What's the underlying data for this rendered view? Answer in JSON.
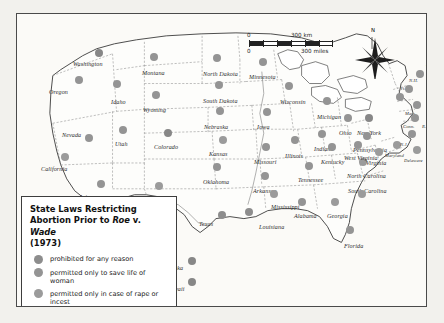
{
  "map": {
    "title": "State Laws Restricting Abortion Prior to Roe v. Wade (1973)",
    "frame_color": "#4a4a4a",
    "background_color": "#fbfaf7"
  },
  "legend": {
    "title_line1": "State Laws Restricting",
    "title_line2_a": "Abortion Prior to ",
    "title_line2_roe": "Roe",
    "title_line2_v": " v. ",
    "title_line2_wade": "Wade",
    "title_line3": "(1973)",
    "items": [
      {
        "label": "prohibited for any reason",
        "color": "#8d8d8d"
      },
      {
        "label": "permitted only to save life of woman",
        "color": "#949494"
      },
      {
        "label": "permitted only in case of rape or incest",
        "color": "#9b9b9b"
      },
      {
        "label": "permitted for any reason",
        "color": "#878787"
      }
    ]
  },
  "scalebar": {
    "km_zero": "0",
    "km_value": "300 km",
    "miles_zero": "0",
    "miles_value": "300 miles"
  },
  "compass": {
    "north_label": "N"
  },
  "chart_data": {
    "type": "map",
    "title": "State Laws Restricting Abortion Prior to Roe v. Wade (1973)",
    "categories": [
      "prohibited for any reason",
      "permitted only to save life of woman",
      "permitted only in case of rape or incest",
      "permitted for any reason"
    ],
    "states": [
      {
        "name": "Washington",
        "label_x": 56,
        "label_y": 47,
        "dot_x": 82,
        "dot_y": 39,
        "cat": 4
      },
      {
        "name": "Oregon",
        "label_x": 32,
        "label_y": 75,
        "dot_x": 62,
        "dot_y": 66,
        "cat": 2
      },
      {
        "name": "Idaho",
        "label_x": 94,
        "label_y": 85,
        "dot_x": 100,
        "dot_y": 70,
        "cat": 2
      },
      {
        "name": "Montana",
        "label_x": 125,
        "label_y": 56,
        "dot_x": 137,
        "dot_y": 43,
        "cat": 2
      },
      {
        "name": "North Dakota",
        "label_x": 186,
        "label_y": 57,
        "dot_x": 200,
        "dot_y": 44,
        "cat": 2
      },
      {
        "name": "Minnesota",
        "label_x": 232,
        "label_y": 60,
        "dot_x": 246,
        "dot_y": 48,
        "cat": 2
      },
      {
        "name": "Wisconsin",
        "label_x": 263,
        "label_y": 85,
        "dot_x": 272,
        "dot_y": 72,
        "cat": 2
      },
      {
        "name": "Michigan",
        "label_x": 300,
        "label_y": 100,
        "dot_x": 310,
        "dot_y": 87,
        "cat": 2
      },
      {
        "name": "South Dakota",
        "label_x": 186,
        "label_y": 84,
        "dot_x": 202,
        "dot_y": 71,
        "cat": 2
      },
      {
        "name": "Wyoming",
        "label_x": 126,
        "label_y": 93,
        "dot_x": 139,
        "dot_y": 81,
        "cat": 2
      },
      {
        "name": "Nebraska",
        "label_x": 187,
        "label_y": 110,
        "dot_x": 203,
        "dot_y": 97,
        "cat": 2
      },
      {
        "name": "Iowa",
        "label_x": 240,
        "label_y": 110,
        "dot_x": 250,
        "dot_y": 98,
        "cat": 2
      },
      {
        "name": "Illinois",
        "label_x": 268,
        "label_y": 139,
        "dot_x": 278,
        "dot_y": 126,
        "cat": 2
      },
      {
        "name": "Indiana",
        "label_x": 297,
        "label_y": 132,
        "dot_x": 305,
        "dot_y": 120,
        "cat": 2
      },
      {
        "name": "Ohio",
        "label_x": 322,
        "label_y": 116,
        "dot_x": 331,
        "dot_y": 104,
        "cat": 2
      },
      {
        "name": "Nevada",
        "label_x": 45,
        "label_y": 118,
        "dot_x": 72,
        "dot_y": 124,
        "cat": 2
      },
      {
        "name": "Utah",
        "label_x": 98,
        "label_y": 127,
        "dot_x": 106,
        "dot_y": 116,
        "cat": 2
      },
      {
        "name": "Colorado",
        "label_x": 137,
        "label_y": 130,
        "dot_x": 151,
        "dot_y": 119,
        "cat": 4
      },
      {
        "name": "Kansas",
        "label_x": 192,
        "label_y": 137,
        "dot_x": 206,
        "dot_y": 126,
        "cat": 3
      },
      {
        "name": "Missouri",
        "label_x": 237,
        "label_y": 145,
        "dot_x": 249,
        "dot_y": 133,
        "cat": 2
      },
      {
        "name": "Kentucky",
        "label_x": 304,
        "label_y": 145,
        "dot_x": 315,
        "dot_y": 133,
        "cat": 2
      },
      {
        "name": "California",
        "label_x": 24,
        "label_y": 152,
        "dot_x": 48,
        "dot_y": 143,
        "cat": 3
      },
      {
        "name": "Arizona",
        "label_x": 62,
        "label_y": 180,
        "dot_x": 84,
        "dot_y": 170,
        "cat": 2
      },
      {
        "name": "New Mexico",
        "label_x": 120,
        "label_y": 184,
        "dot_x": 142,
        "dot_y": 172,
        "cat": 3
      },
      {
        "name": "Oklahoma",
        "label_x": 186,
        "label_y": 165,
        "dot_x": 200,
        "dot_y": 153,
        "cat": 2
      },
      {
        "name": "Arkansas",
        "label_x": 236,
        "label_y": 174,
        "dot_x": 248,
        "dot_y": 162,
        "cat": 2
      },
      {
        "name": "Tennessee",
        "label_x": 281,
        "label_y": 163,
        "dot_x": 292,
        "dot_y": 152,
        "cat": 2
      },
      {
        "name": "North Carolina",
        "label_x": 330,
        "label_y": 159,
        "dot_x": 346,
        "dot_y": 148,
        "cat": 3
      },
      {
        "name": "South Carolina",
        "label_x": 331,
        "label_y": 174,
        "dot_x": 345,
        "dot_y": 180,
        "cat": 3
      },
      {
        "name": "Mississippi",
        "label_x": 254,
        "label_y": 190,
        "dot_x": 257,
        "dot_y": 180,
        "cat": 3
      },
      {
        "name": "Alabama",
        "label_x": 277,
        "label_y": 199,
        "dot_x": 285,
        "dot_y": 188,
        "cat": 2
      },
      {
        "name": "Georgia",
        "label_x": 310,
        "label_y": 199,
        "dot_x": 318,
        "dot_y": 188,
        "cat": 3
      },
      {
        "name": "Louisiana",
        "label_x": 242,
        "label_y": 210,
        "dot_x": 232,
        "dot_y": 198,
        "cat": 1
      },
      {
        "name": "Texas",
        "label_x": 182,
        "label_y": 207,
        "dot_x": 205,
        "dot_y": 201,
        "cat": 1
      },
      {
        "name": "Florida",
        "label_x": 327,
        "label_y": 229,
        "dot_x": 333,
        "dot_y": 216,
        "cat": 2
      },
      {
        "name": "New York",
        "label_x": 340,
        "label_y": 116,
        "dot_x": 352,
        "dot_y": 104,
        "cat": 4
      },
      {
        "name": "Pennsylvania",
        "label_x": 336,
        "label_y": 133,
        "dot_x": 350,
        "dot_y": 122,
        "cat": 2
      },
      {
        "name": "West Virginia",
        "label_x": 327,
        "label_y": 141,
        "dot_x": 341,
        "dot_y": 131,
        "cat": 2
      },
      {
        "name": "Virginia",
        "label_x": 349,
        "label_y": 146,
        "dot_x": 362,
        "dot_y": 138,
        "cat": 3
      },
      {
        "name": "Maryland",
        "label_x": 368,
        "label_y": 139,
        "dot_x": 380,
        "dot_y": 131,
        "cat": 3
      },
      {
        "name": "Delaware",
        "label_x": 387,
        "label_y": 144,
        "dot_x": 400,
        "dot_y": 136,
        "cat": 3
      },
      {
        "name": "N.J.",
        "label_x": 383,
        "label_y": 128,
        "dot_x": 395,
        "dot_y": 120,
        "cat": 2
      },
      {
        "name": "Maine",
        "label_x": 409,
        "label_y": 48,
        "dot_x": 403,
        "dot_y": 60,
        "cat": 2
      },
      {
        "name": "N.H.",
        "label_x": 392,
        "label_y": 64,
        "dot_x": 392,
        "dot_y": 75,
        "cat": 2
      },
      {
        "name": "Vt.",
        "label_x": 383,
        "label_y": 72,
        "dot_x": 383,
        "dot_y": 83,
        "cat": 2
      },
      {
        "name": "Mass.",
        "label_x": 388,
        "label_y": 97,
        "dot_x": 400,
        "dot_y": 91,
        "cat": 2
      },
      {
        "name": "Conn.",
        "label_x": 386,
        "label_y": 110,
        "dot_x": 398,
        "dot_y": 104,
        "cat": 2
      },
      {
        "name": "R.I.",
        "label_x": 405,
        "label_y": 110,
        "dot_x": 413,
        "dot_y": 102,
        "cat": 2
      },
      {
        "name": "Alaska",
        "label_x": 149,
        "label_y": 251,
        "dot_x": 175,
        "dot_y": 247,
        "cat": 4
      },
      {
        "name": "Hawaii",
        "label_x": 149,
        "label_y": 272,
        "dot_x": 175,
        "dot_y": 268,
        "cat": 4
      }
    ]
  }
}
